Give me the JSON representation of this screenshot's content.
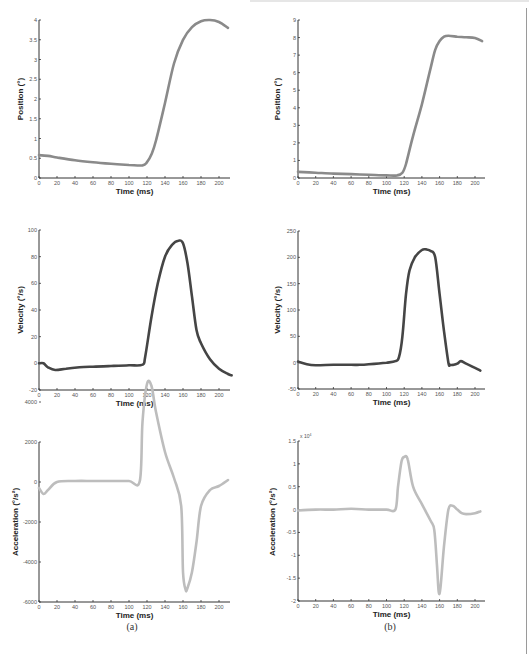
{
  "figure": {
    "captions": [
      "(a)",
      "(b)"
    ],
    "xlabel": "Time (ms)",
    "colors": {
      "position": "#8a8a8a",
      "velocity": "#454545",
      "acceleration": "#bdbdbd",
      "axis": "#333333"
    }
  },
  "chart_data": [
    {
      "id": "a-position",
      "type": "line",
      "title": "",
      "xlabel": "Time (ms)",
      "ylabel": "Position (°)",
      "xlim": [
        0,
        210
      ],
      "ylim": [
        0,
        4
      ],
      "xticks": [
        0,
        20,
        40,
        60,
        80,
        100,
        120,
        140,
        160,
        180,
        200
      ],
      "yticks": [
        "0",
        "0.5",
        "1",
        "1.5",
        "2",
        "2.5",
        "3",
        "3.5",
        "4"
      ],
      "x": [
        0,
        10,
        20,
        40,
        60,
        80,
        100,
        115,
        120,
        125,
        130,
        140,
        150,
        160,
        170,
        180,
        190,
        200,
        210
      ],
      "y": [
        0.58,
        0.56,
        0.52,
        0.45,
        0.4,
        0.36,
        0.33,
        0.32,
        0.4,
        0.6,
        0.95,
        1.9,
        2.9,
        3.5,
        3.82,
        3.97,
        4.0,
        3.95,
        3.8
      ]
    },
    {
      "id": "b-position",
      "type": "line",
      "title": "",
      "xlabel": "Time (ms)",
      "ylabel": "Position (°)",
      "xlim": [
        0,
        210
      ],
      "ylim": [
        0,
        9
      ],
      "xticks": [
        0,
        20,
        40,
        60,
        80,
        100,
        120,
        140,
        160,
        180,
        200
      ],
      "yticks": [
        "0",
        "1",
        "2",
        "3",
        "4",
        "5",
        "6",
        "7",
        "8",
        "9"
      ],
      "x": [
        0,
        20,
        40,
        60,
        80,
        100,
        112,
        118,
        122,
        130,
        140,
        150,
        155,
        160,
        165,
        170,
        180,
        190,
        200,
        208
      ],
      "y": [
        0.35,
        0.3,
        0.25,
        0.22,
        0.18,
        0.15,
        0.15,
        0.3,
        0.8,
        2.4,
        4.2,
        6.3,
        7.3,
        7.8,
        8.05,
        8.1,
        8.05,
        8.02,
        7.98,
        7.8
      ]
    },
    {
      "id": "a-velocity",
      "type": "line",
      "title": "",
      "xlabel": "Time (ms)",
      "ylabel": "Velocity (°/s)",
      "xlim": [
        0,
        215
      ],
      "ylim": [
        -20,
        100
      ],
      "xticks": [
        0,
        20,
        40,
        60,
        80,
        100,
        120,
        140,
        160,
        180,
        200
      ],
      "yticks": [
        "-20",
        "0",
        "20",
        "40",
        "60",
        "80",
        "100"
      ],
      "x": [
        0,
        5,
        10,
        18,
        30,
        45,
        60,
        80,
        100,
        115,
        118,
        125,
        132,
        140,
        148,
        155,
        160,
        165,
        170,
        175,
        180,
        190,
        200,
        210,
        214
      ],
      "y": [
        0,
        0,
        -3,
        -5,
        -4,
        -3,
        -2.5,
        -2,
        -1.5,
        -1,
        5,
        35,
        60,
        80,
        89,
        92,
        90,
        75,
        50,
        25,
        15,
        3,
        -4,
        -8,
        -9
      ]
    },
    {
      "id": "b-velocity",
      "type": "line",
      "title": "",
      "xlabel": "Time (ms)",
      "ylabel": "Velocity (°/s)",
      "xlim": [
        0,
        210
      ],
      "ylim": [
        -50,
        250
      ],
      "xticks": [
        0,
        20,
        40,
        60,
        80,
        100,
        120,
        140,
        160,
        180,
        200
      ],
      "yticks": [
        "-50",
        "0",
        "50",
        "100",
        "150",
        "200",
        "250"
      ],
      "x": [
        0,
        10,
        20,
        40,
        60,
        70,
        80,
        100,
        110,
        114,
        118,
        122,
        126,
        132,
        140,
        145,
        150,
        155,
        160,
        165,
        170,
        172,
        176,
        180,
        184,
        190,
        200,
        206
      ],
      "y": [
        2,
        -3,
        -5,
        -4,
        -4,
        -4,
        -3,
        0,
        3,
        10,
        50,
        130,
        175,
        200,
        214,
        215,
        212,
        200,
        130,
        60,
        0,
        -4,
        -4,
        -2,
        3,
        -2,
        -10,
        -15
      ]
    },
    {
      "id": "a-acceleration",
      "type": "line",
      "title": "",
      "xlabel": "Time (ms)",
      "ylabel": "Acceleration (°/s²)",
      "xlim": [
        0,
        212
      ],
      "ylim": [
        -6000,
        2000
      ],
      "xticks": [
        0,
        20,
        40,
        60,
        80,
        100,
        120,
        140,
        160,
        180,
        200
      ],
      "yticks": [
        "-6000",
        "-4000",
        "-2000",
        "0",
        "2000",
        "4000"
      ],
      "x": [
        0,
        5,
        10,
        20,
        40,
        60,
        80,
        100,
        112,
        115,
        120,
        125,
        130,
        140,
        150,
        158,
        160,
        163,
        165,
        170,
        175,
        180,
        190,
        200,
        210
      ],
      "y": [
        -300,
        -600,
        -400,
        0,
        50,
        50,
        50,
        50,
        50,
        3000,
        4900,
        4800,
        3500,
        1500,
        200,
        -1200,
        -4500,
        -5400,
        -5300,
        -4500,
        -3000,
        -1200,
        -400,
        -200,
        100
      ]
    },
    {
      "id": "b-acceleration",
      "type": "line",
      "title": "",
      "xlabel": "Time (ms)",
      "ylabel": "Acceleration (°/s²)",
      "y_multiplier": "x 10^4",
      "xlim": [
        0,
        210
      ],
      "ylim": [
        -2,
        1.5
      ],
      "xticks": [
        0,
        20,
        40,
        60,
        80,
        100,
        120,
        140,
        160,
        180,
        200
      ],
      "yticks": [
        "-2",
        "-1.5",
        "-1",
        "-0.5",
        "0",
        "0.5",
        "1",
        "1.5"
      ],
      "x": [
        0,
        20,
        40,
        60,
        80,
        100,
        110,
        113,
        117,
        120,
        124,
        130,
        140,
        150,
        154,
        157,
        159,
        161,
        165,
        170,
        175,
        180,
        185,
        190,
        200,
        206
      ],
      "y": [
        -0.02,
        0.0,
        0.0,
        0.02,
        0.0,
        0.0,
        0.0,
        0.5,
        1.05,
        1.15,
        1.1,
        0.5,
        0.12,
        -0.25,
        -0.45,
        -1.2,
        -1.8,
        -1.7,
        -0.8,
        0.0,
        0.08,
        0.0,
        -0.08,
        -0.1,
        -0.08,
        -0.04
      ]
    }
  ]
}
